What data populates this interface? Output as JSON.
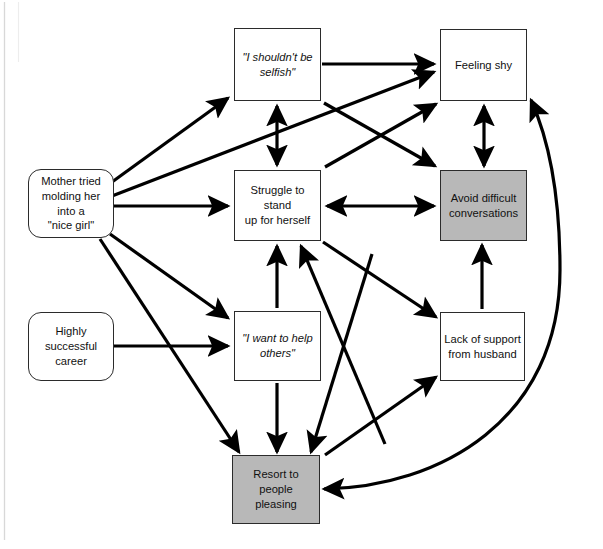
{
  "diagram": {
    "background_color": "#ffffff",
    "line_color": "#000000",
    "shaded_fill": "#b8b8b8",
    "plain_fill": "#ffffff",
    "border_color": "#2b2b2b",
    "nodes": [
      {
        "id": "mother",
        "label": "Mother tried\nmolding her into a\n\"nice girl\"",
        "shape": "rounded-rectangle",
        "fill": "#ffffff",
        "italic": false,
        "x": 28,
        "y": 169,
        "w": 86,
        "h": 69
      },
      {
        "id": "career",
        "label": "Highly successful\ncareer",
        "shape": "rounded-rectangle",
        "fill": "#ffffff",
        "italic": false,
        "x": 28,
        "y": 312,
        "w": 86,
        "h": 69
      },
      {
        "id": "selfish",
        "label": "\"I shouldn't be\nselfish\"",
        "shape": "rectangle",
        "fill": "#ffffff",
        "italic": true,
        "x": 234,
        "y": 28,
        "w": 87,
        "h": 73
      },
      {
        "id": "shy",
        "label": "Feeling shy",
        "shape": "rectangle",
        "fill": "#ffffff",
        "italic": false,
        "x": 440,
        "y": 29,
        "w": 87,
        "h": 72
      },
      {
        "id": "struggle",
        "label": "Struggle to stand\nup for herself",
        "shape": "rectangle",
        "fill": "#ffffff",
        "italic": false,
        "x": 234,
        "y": 170,
        "w": 87,
        "h": 71
      },
      {
        "id": "avoid",
        "label": "Avoid difficult\nconversations",
        "shape": "rectangle",
        "fill": "#b8b8b8",
        "italic": false,
        "x": 440,
        "y": 170,
        "w": 87,
        "h": 71
      },
      {
        "id": "help",
        "label": "\"I want to help\nothers\"",
        "shape": "rectangle",
        "fill": "#ffffff",
        "italic": true,
        "x": 234,
        "y": 311,
        "w": 87,
        "h": 70
      },
      {
        "id": "husband",
        "label": "Lack of support\nfrom husband",
        "shape": "rectangle",
        "fill": "#ffffff",
        "italic": false,
        "x": 440,
        "y": 312,
        "w": 85,
        "h": 69
      },
      {
        "id": "pleasing",
        "label": "Resort to people\npleasing",
        "shape": "rectangle",
        "fill": "#b8b8b8",
        "italic": false,
        "x": 232,
        "y": 455,
        "w": 88,
        "h": 69
      }
    ],
    "edges": [
      {
        "from": "mother",
        "to": "selfish",
        "style": "straight",
        "arrows": "single"
      },
      {
        "from": "mother",
        "to": "shy",
        "style": "straight",
        "arrows": "single"
      },
      {
        "from": "mother",
        "to": "struggle",
        "style": "straight",
        "arrows": "single"
      },
      {
        "from": "mother",
        "to": "help",
        "style": "straight",
        "arrows": "single"
      },
      {
        "from": "mother",
        "to": "pleasing",
        "style": "straight",
        "arrows": "single"
      },
      {
        "from": "career",
        "to": "help",
        "style": "straight",
        "arrows": "single"
      },
      {
        "from": "selfish",
        "to": "shy",
        "style": "straight",
        "arrows": "single"
      },
      {
        "from": "selfish",
        "to": "struggle",
        "style": "straight",
        "arrows": "double"
      },
      {
        "from": "selfish",
        "to": "avoid",
        "style": "straight",
        "arrows": "single"
      },
      {
        "from": "struggle",
        "to": "shy",
        "style": "straight",
        "arrows": "single"
      },
      {
        "from": "struggle",
        "to": "avoid",
        "style": "straight",
        "arrows": "double"
      },
      {
        "from": "struggle",
        "to": "husband",
        "style": "straight",
        "arrows": "single"
      },
      {
        "from": "struggle",
        "to": "pleasing",
        "style": "straight",
        "arrows": "single"
      },
      {
        "from": "shy",
        "to": "avoid",
        "style": "straight",
        "arrows": "double"
      },
      {
        "from": "help",
        "to": "struggle",
        "style": "straight",
        "arrows": "single"
      },
      {
        "from": "help",
        "to": "pleasing",
        "style": "straight",
        "arrows": "single"
      },
      {
        "from": "husband",
        "to": "avoid",
        "style": "straight",
        "arrows": "single"
      },
      {
        "from": "pleasing",
        "to": "struggle",
        "style": "straight",
        "arrows": "single"
      },
      {
        "from": "pleasing",
        "to": "husband",
        "style": "straight",
        "arrows": "single"
      },
      {
        "from": "pleasing",
        "to": "shy",
        "style": "curved",
        "arrows": "double"
      }
    ]
  }
}
